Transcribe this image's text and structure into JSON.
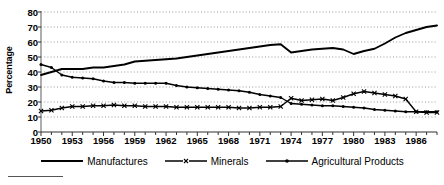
{
  "chart_data": {
    "type": "line",
    "title": "",
    "xlabel": "",
    "ylabel": "Percentage",
    "xlim": [
      1950,
      1988
    ],
    "ylim": [
      0,
      80
    ],
    "grid": true,
    "grid_style": "dotted-horizontal",
    "legend_position": "bottom",
    "y_ticks": [
      0,
      10,
      20,
      30,
      40,
      50,
      60,
      70,
      80
    ],
    "y_tick_labels": [
      "0",
      "10",
      "20",
      "30",
      "40",
      "50",
      "60",
      "70",
      "80"
    ],
    "x_ticks": [
      1950,
      1953,
      1956,
      1959,
      1962,
      1965,
      1968,
      1971,
      1974,
      1977,
      1980,
      1983,
      1986
    ],
    "x_tick_labels": [
      "1950",
      "1953",
      "1956",
      "1959",
      "1962",
      "1965",
      "1968",
      "1971",
      "1974",
      "1977",
      "1980",
      "1983",
      "1986"
    ],
    "x_minor_ticks_every": 1,
    "x": [
      1950,
      1951,
      1952,
      1953,
      1954,
      1955,
      1956,
      1957,
      1958,
      1959,
      1960,
      1961,
      1962,
      1963,
      1964,
      1965,
      1966,
      1967,
      1968,
      1969,
      1970,
      1971,
      1972,
      1973,
      1974,
      1975,
      1976,
      1977,
      1978,
      1979,
      1980,
      1981,
      1982,
      1983,
      1984,
      1985,
      1986,
      1987,
      1988
    ],
    "series": [
      {
        "name": "Manufactures",
        "marker": "none",
        "color": "#000000",
        "values": [
          38,
          40,
          42,
          42,
          42,
          43,
          43,
          44,
          45,
          47,
          47.5,
          48,
          48.5,
          49,
          50,
          51,
          52,
          53,
          54,
          55,
          56,
          57,
          58,
          58.5,
          53,
          54,
          55,
          55.5,
          56,
          55,
          52,
          54,
          55.5,
          59,
          63,
          66,
          68,
          70,
          71
        ]
      },
      {
        "name": "Minerals",
        "marker": "x",
        "color": "#000000",
        "values": [
          14,
          14.5,
          16,
          17,
          17,
          17.5,
          17.5,
          18,
          17.5,
          17.5,
          17,
          17,
          17,
          16.5,
          16.5,
          16.5,
          16.5,
          16.5,
          16.5,
          16,
          16,
          16.5,
          16.5,
          17,
          22.5,
          21,
          21.5,
          22,
          21,
          23,
          25.5,
          27,
          26,
          25,
          24,
          22,
          13.5,
          13,
          13
        ]
      },
      {
        "name": "Agricultural Products",
        "marker": "dot",
        "color": "#000000",
        "values": [
          45,
          43,
          38,
          36.5,
          36,
          35.5,
          34,
          33,
          33,
          32.5,
          32.5,
          32.5,
          32.5,
          31,
          30,
          29.5,
          29,
          28.5,
          28,
          27.5,
          26.5,
          25,
          24,
          23,
          19,
          18.5,
          18,
          17.5,
          17.5,
          17,
          16.5,
          16,
          15,
          14.5,
          14,
          13.5,
          13.5,
          13.5,
          13.5
        ]
      }
    ]
  },
  "legend": {
    "items": [
      {
        "label": "Manufactures",
        "marker": "none"
      },
      {
        "label": "Minerals",
        "marker": "x"
      },
      {
        "label": "Agricultural Products",
        "marker": "dot"
      }
    ]
  },
  "axis": {
    "y_title": "Percentage"
  }
}
